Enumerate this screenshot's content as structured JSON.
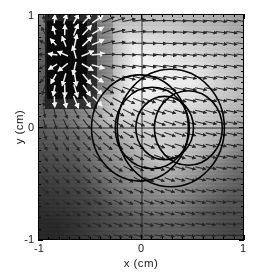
{
  "figure": {
    "kind": "quiver-field-with-wavefronts",
    "background_color": "#ffffff"
  },
  "axes": {
    "x": {
      "title": "x (cm)",
      "tick_labels": [
        "-1",
        "0",
        "1"
      ],
      "tick_values": [
        -1,
        0,
        1
      ],
      "limits": [
        -1,
        1
      ],
      "minor_tick_step": 0.1
    },
    "y": {
      "title": "y (cm)",
      "tick_labels": [
        "-1",
        "0",
        "1"
      ],
      "tick_values": [
        -1,
        0,
        1
      ],
      "limits": [
        -1,
        1
      ],
      "minor_tick_step": 0.1
    },
    "frame_color": "#000000",
    "ticks_on_all_sides": true
  },
  "chart_data": {
    "type": "heatmap",
    "title": "",
    "xlabel": "x (cm)",
    "ylabel": "y (cm)",
    "xlim": [
      -1,
      1
    ],
    "ylim": [
      -1,
      1
    ],
    "grid": false,
    "legend": "none",
    "colormap": "grayscale",
    "overlays": {
      "quiver": {
        "description": "vector field arrows on a regular grid",
        "grid_nx": 20,
        "grid_ny": 20,
        "arrow_color_dark": "#2a2a2a",
        "arrow_color_light": "#f2f2f2",
        "source_center": [
          -0.62,
          0.6
        ],
        "notes": "arrows radiate outward from the dark square source and flow rightward/outward elsewhere"
      },
      "source_patch": {
        "description": "dark square low-intensity region",
        "x_range": [
          -0.88,
          -0.38
        ],
        "y_range": [
          0.17,
          1.0
        ],
        "fill": "#151515"
      },
      "bright_lobe": {
        "description": "high-intensity lobe in upper right quadrant",
        "center": [
          0.33,
          0.55
        ],
        "fill": "#fbfbfb"
      },
      "wavefront_arcs": {
        "description": "black circular wavefront arcs centered on the y=0 axis",
        "color": "#000000",
        "line_width": 1.6,
        "circles": [
          {
            "cx": -0.02,
            "cy": 0.0,
            "r": 0.47
          },
          {
            "cx": 0.1,
            "cy": 0.0,
            "r": 0.36
          },
          {
            "cx": 0.22,
            "cy": 0.0,
            "r": 0.28
          },
          {
            "cx": 0.28,
            "cy": 0.0,
            "r": 0.52
          },
          {
            "cx": 0.45,
            "cy": 0.0,
            "r": 0.33
          }
        ],
        "focus_points": [
          [
            -0.02,
            0.0
          ],
          [
            0.28,
            0.0
          ]
        ]
      },
      "axis_crosshair": {
        "x_zero_line": true,
        "y_zero_line": true,
        "color": "#2b2b2b"
      }
    }
  },
  "colors": {
    "frame": "#000000",
    "text": "#1a1a1a",
    "arc": "#000000",
    "dark_patch": "#151515",
    "bright_patch": "#fbfbfb",
    "mid_gray": "#9a9a9a"
  }
}
